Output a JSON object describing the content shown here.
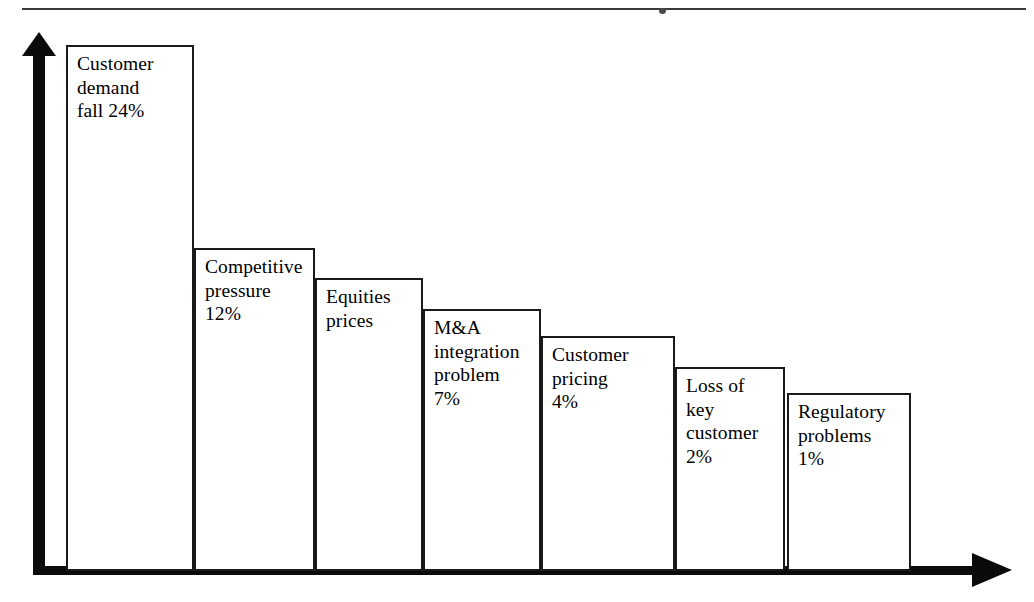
{
  "figure": {
    "name": "pareto-bar-chart-of-profit-warning-causes",
    "top_rule": true,
    "axis": {
      "y_axis_name": "vertical-axis-arrow",
      "x_axis_name": "horizontal-axis-arrow",
      "y_tick_labels": [],
      "x_tick_labels": []
    }
  },
  "chart_data": {
    "type": "bar",
    "title": "",
    "subtitle": "",
    "xlabel": "",
    "ylabel": "",
    "grid": false,
    "legend": "none",
    "axis_style": "arrow-axes, no tick marks, no tick labels",
    "value_unit": "percent",
    "categories": [
      "Customer demand fall",
      "Competitive pressure",
      "Equities prices",
      "M&A integration problem",
      "Customer pricing",
      "Loss of key customer",
      "Regulatory problems"
    ],
    "values": [
      24,
      12,
      10,
      7,
      4,
      2,
      1
    ],
    "value_labels": [
      "24%",
      "12%",
      "",
      "7%",
      "4%",
      "2%",
      "1%"
    ],
    "ylim": [
      0,
      26
    ],
    "bars": [
      {
        "id": "bar-customer-demand-fall",
        "label_text": "Customer\ndemand\nfall 24%",
        "category": "Customer demand fall",
        "value": 24,
        "value_label": "24%",
        "left": 66,
        "top": 45,
        "width": 128,
        "height": 526
      },
      {
        "id": "bar-competitive-pressure",
        "label_text": "Competitive\npressure\n12%",
        "category": "Competitive pressure",
        "value": 12,
        "value_label": "12%",
        "left": 194,
        "top": 248,
        "width": 121,
        "height": 323
      },
      {
        "id": "bar-equities-prices",
        "label_text": "Equities\nprices",
        "category": "Equities prices",
        "value": 10,
        "value_label": "",
        "left": 315,
        "top": 278,
        "width": 108,
        "height": 293
      },
      {
        "id": "bar-ma-integration-problem",
        "label_text": "M&A\nintegration\nproblem\n7%",
        "category": "M&A integration problem",
        "value": 7,
        "value_label": "7%",
        "left": 423,
        "top": 309,
        "width": 118,
        "height": 262
      },
      {
        "id": "bar-customer-pricing",
        "label_text": "Customer\npricing\n4%",
        "category": "Customer pricing",
        "value": 4,
        "value_label": "4%",
        "left": 541,
        "top": 336,
        "width": 134,
        "height": 235
      },
      {
        "id": "bar-loss-of-key-customer",
        "label_text": "Loss of\nkey\ncustomer\n2%",
        "category": "Loss of key customer",
        "value": 2,
        "value_label": "2%",
        "left": 675,
        "top": 367,
        "width": 110,
        "height": 204
      },
      {
        "id": "bar-regulatory-problems",
        "label_text": "Regulatory\nproblems\n1%",
        "category": "Regulatory problems",
        "value": 1,
        "value_label": "1%",
        "left": 787,
        "top": 393,
        "width": 124,
        "height": 178
      }
    ]
  },
  "colors": {
    "background": "#ffffff",
    "axis": "#0b0b0b",
    "bar_border": "#1a1a1a",
    "bar_fill": "#ffffff",
    "text": "#000000",
    "rule": "#3a3a3a"
  }
}
